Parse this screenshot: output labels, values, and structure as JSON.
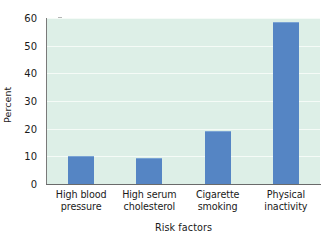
{
  "chart_data": {
    "type": "bar",
    "title": "",
    "subtitle": "",
    "categories": [
      "High blood\npressure",
      "High serum\ncholesterol",
      "Cigarette\nsmoking",
      "Physical\ninactivity"
    ],
    "category_lines": [
      [
        "High blood",
        "pressure"
      ],
      [
        "High serum",
        "cholesterol"
      ],
      [
        "Cigarette",
        "smoking"
      ],
      [
        "Physical",
        "inactivity"
      ]
    ],
    "values": [
      10,
      9.5,
      19,
      58.5
    ],
    "xlabel": "Risk factors",
    "ylabel": "Percent",
    "ylim": [
      0,
      60
    ],
    "yticks": [
      0,
      10,
      20,
      30,
      40,
      50,
      60
    ],
    "ytick_labels": [
      "0",
      "10",
      "20",
      "30",
      "40",
      "50",
      "60"
    ],
    "grid": true,
    "grid_axis": "y",
    "legend": false,
    "legend_position": "none",
    "bar_color": "#5585c4",
    "plot_background": "#ddefe7",
    "gridline_color": "#f6fbf8",
    "axis_color": "#6f6f6f",
    "text_color": "#1a1a1a",
    "figure_background": "#ffffff"
  }
}
